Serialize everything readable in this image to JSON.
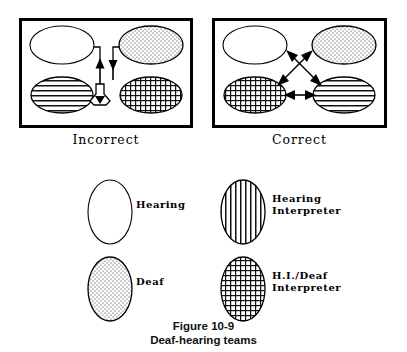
{
  "figure": {
    "number": "Figure 10-9",
    "title": "Deaf-hearing teams"
  },
  "panels": [
    {
      "id": "incorrect",
      "caption": "Incorrect",
      "nodes": [
        {
          "position": "top-left",
          "role": "Hearing",
          "fill": "white"
        },
        {
          "position": "top-right",
          "role": "Deaf",
          "fill": "dots"
        },
        {
          "position": "bottom-left",
          "role": "Hearing Interpreter",
          "fill": "horizontal-lines"
        },
        {
          "position": "bottom-right",
          "role": "H.I./Deaf Interpreter",
          "fill": "cross-hatch"
        }
      ],
      "connections": "funneled-through-single-channel"
    },
    {
      "id": "correct",
      "caption": "Correct",
      "nodes": [
        {
          "position": "top-left",
          "role": "Hearing",
          "fill": "white"
        },
        {
          "position": "top-right",
          "role": "Deaf",
          "fill": "dots"
        },
        {
          "position": "bottom-left",
          "role": "H.I./Deaf Interpreter",
          "fill": "cross-hatch"
        },
        {
          "position": "bottom-right",
          "role": "Hearing Interpreter",
          "fill": "horizontal-lines"
        }
      ],
      "connections": "crossed-double-arrows-plus-horizontal"
    }
  ],
  "legend": [
    {
      "key": "hearing",
      "label": "Hearing",
      "fill": "white"
    },
    {
      "key": "hearing-interpreter",
      "label": "Hearing\nInterpreter",
      "fill": "vertical-lines"
    },
    {
      "key": "deaf",
      "label": "Deaf",
      "fill": "dots"
    },
    {
      "key": "hi-deaf-interpreter",
      "label": "H.I./Deaf\nInterpreter",
      "fill": "cross-hatch"
    }
  ],
  "colors": {
    "ink": "#000000",
    "paper": "#ffffff",
    "hatch": "#1a1a1a"
  }
}
